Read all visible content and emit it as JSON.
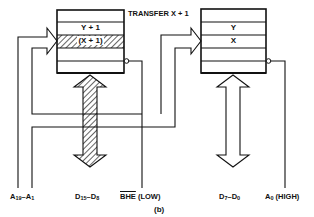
{
  "title": "TRANSFER X + 1",
  "caption": "(b)",
  "left_memory": {
    "rows": [
      "",
      "Y + 1",
      "(X + 1)",
      "",
      ""
    ],
    "highlighted_row": 2
  },
  "right_memory": {
    "rows": [
      "",
      "Y",
      "X",
      "",
      ""
    ]
  },
  "labels": {
    "address_high": {
      "base": "A",
      "sub1": "19",
      "sep": "–A",
      "sub2": "1"
    },
    "data_high": {
      "base": "D",
      "sub1": "15",
      "sep": "–D",
      "sub2": "8"
    },
    "bhe": {
      "signal": "BHE",
      "state": " (LOW)"
    },
    "data_low": {
      "base": "D",
      "sub1": "7",
      "sep": "–D",
      "sub2": "0"
    },
    "a0": {
      "base": "A",
      "sub1": "0",
      "state": " (HIGH)"
    }
  },
  "colors": {
    "ink": "#111111",
    "background": "#ffffff"
  }
}
